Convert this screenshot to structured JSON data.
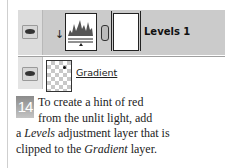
{
  "layers_panel": {
    "layers": [
      {
        "name": "Levels 1",
        "type": "adjustment",
        "visible": true,
        "clipped": true,
        "icons": [
          "eye-icon",
          "clipping-arrow-icon",
          "levels-histogram-thumbnail",
          "chain-link-icon",
          "layer-mask-thumbnail"
        ]
      },
      {
        "name": "Gradient",
        "type": "pixel",
        "visible": true,
        "icons": [
          "eye-icon",
          "transparent-checker-thumbnail"
        ]
      }
    ]
  },
  "caption": {
    "step_number": "14",
    "line1": "To create a hint of red",
    "line2": "from the unlit light, add",
    "line3_pre": "a ",
    "line3_em": "Levels",
    "line3_post": " adjustment layer that is",
    "line4_pre": "clipped to the ",
    "line4_em": "Gradient",
    "line4_post": " layer."
  },
  "colors": {
    "selected_row": "#cbcbcb",
    "step_badge": "#9a9a9a",
    "text": "#222222"
  }
}
